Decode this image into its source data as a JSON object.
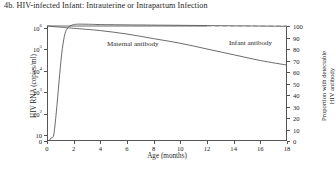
{
  "figure": {
    "title": "4b. HIV-infected Infant: Intrauterine or Intrapartum Infection"
  },
  "annotations": {
    "maternal": "Maternal antibody",
    "infant": "Infant antibody"
  },
  "axes": {
    "x": {
      "label": "Age (months)",
      "ticks": [
        "0",
        "2",
        "4",
        "6",
        "8",
        "10",
        "12",
        "14",
        "16",
        "18"
      ]
    },
    "y_left": {
      "label": "HIV RNA (copies/ml)",
      "ticks": [
        "0",
        "10",
        "10",
        "10",
        "10",
        "10",
        "10"
      ],
      "exponents": [
        "",
        "",
        "2",
        "3",
        "4",
        "5",
        "6"
      ]
    },
    "y_right": {
      "label_line1": "Proportion with detectable",
      "label_line2": "HIV antibody",
      "ticks": [
        "0",
        "10",
        "20",
        "30",
        "40",
        "50",
        "60",
        "70",
        "80",
        "90",
        "100"
      ]
    }
  },
  "chart_data": {
    "type": "line",
    "title": "4b. HIV-infected Infant: Intrauterine or Intrapartum Infection",
    "xlabel": "Age (months)",
    "ylabel": "HIV RNA (copies/ml)",
    "ylabel_secondary": "Proportion with detectable HIV antibody",
    "xlim": [
      0,
      18
    ],
    "ylim_left_log": [
      1,
      1000000
    ],
    "ylim_right": [
      0,
      100
    ],
    "grid": false,
    "legend": "in-plot annotations",
    "series": [
      {
        "name": "HIV RNA (copies/ml)",
        "axis": "left",
        "scale": "log",
        "style": "solid",
        "x": [
          0.3,
          0.5,
          0.7,
          0.9,
          1.1,
          1.3,
          1.5,
          1.8,
          2.2,
          3.0,
          4.0
        ],
        "values": [
          3,
          10,
          120,
          3000,
          60000,
          400000,
          900000,
          1300000,
          1500000,
          1500000,
          1450000
        ]
      },
      {
        "name": "Maternal antibody",
        "axis": "right",
        "style": "solid",
        "x": [
          0,
          2,
          4,
          6,
          8,
          10,
          12
        ],
        "values": [
          100,
          100,
          100,
          100,
          100,
          100,
          100
        ]
      },
      {
        "name": "Infant antibody",
        "axis": "right",
        "style": "dashed",
        "x": [
          12,
          14,
          16,
          18
        ],
        "values": [
          100,
          100,
          100,
          100
        ]
      },
      {
        "name": "Detectable HIV antibody (observed)",
        "axis": "right",
        "style": "solid",
        "x": [
          0,
          1,
          2,
          4,
          6,
          8,
          10,
          12,
          14,
          16,
          18
        ],
        "values": [
          100,
          99,
          98,
          96,
          93,
          89,
          85,
          80,
          75,
          70,
          66
        ]
      }
    ]
  }
}
